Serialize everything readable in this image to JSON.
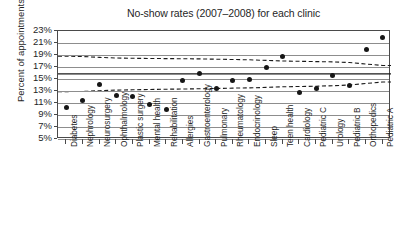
{
  "chart_data": {
    "type": "scatter",
    "title": "No-show rates (2007–2008) for each clinic",
    "xlabel": "",
    "ylabel": "Percent of appointments",
    "ylim": [
      5,
      23
    ],
    "ytick_labels": [
      "23%",
      "21%",
      "19%",
      "17%",
      "15%",
      "13%",
      "11%",
      "9%",
      "7%",
      "5%"
    ],
    "ytick_values": [
      23,
      21,
      19,
      17,
      15,
      13,
      11,
      9,
      7,
      5
    ],
    "grid": true,
    "legend": "none",
    "categories": [
      "Diabetes",
      "Nephrology",
      "Neurosurgery",
      "Ophthalmology",
      "Plastic surgery",
      "Mental health",
      "Rehabilitation",
      "Allergies",
      "Gastroenterology",
      "Pulmonary",
      "Rheumatology",
      "Endocrinology",
      "Sleep",
      "Teen health",
      "Cardiology",
      "Pediatric C",
      "Urology",
      "Pediatric B",
      "Orthopedics",
      "Pediatric A"
    ],
    "values": [
      10.3,
      11.4,
      14.1,
      12.2,
      12.1,
      10.8,
      10.0,
      14.7,
      15.9,
      13.5,
      14.7,
      15.0,
      17.0,
      18.8,
      12.8,
      13.5,
      15.6,
      13.9,
      19.9,
      22.0
    ],
    "series": [
      {
        "name": "No-show rate",
        "values": [
          10.3,
          11.4,
          14.1,
          12.2,
          12.1,
          10.8,
          10.0,
          14.7,
          15.9,
          13.5,
          14.7,
          15.0,
          17.0,
          18.8,
          12.8,
          13.5,
          15.6,
          13.9,
          19.9,
          22.0
        ]
      }
    ],
    "center_line": {
      "name": "Center line",
      "style": "solid",
      "values": [
        15.85,
        15.85,
        15.85,
        15.85,
        15.85,
        15.85,
        15.85,
        15.85,
        15.85,
        15.85,
        15.85,
        15.85,
        15.85,
        15.85,
        15.85,
        15.85,
        15.85,
        15.85,
        15.85,
        15.85
      ]
    },
    "upper_limit": {
      "name": "Upper control limit",
      "style": "dashed",
      "values": [
        18.8,
        18.75,
        18.6,
        18.5,
        18.45,
        18.42,
        18.4,
        18.38,
        18.35,
        18.3,
        18.25,
        18.2,
        18.1,
        18.0,
        17.95,
        17.9,
        17.85,
        17.75,
        17.5,
        17.25
      ]
    },
    "lower_limit": {
      "name": "Lower control limit",
      "style": "dashed",
      "values": [
        12.9,
        12.92,
        13.05,
        13.15,
        13.2,
        13.25,
        13.3,
        13.33,
        13.37,
        13.42,
        13.48,
        13.52,
        13.6,
        13.7,
        13.75,
        13.8,
        13.88,
        14.0,
        14.25,
        14.5
      ]
    }
  }
}
